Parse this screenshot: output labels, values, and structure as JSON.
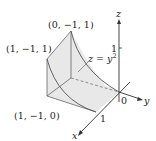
{
  "figure": {
    "points": {
      "top": "(0, −1, 1)",
      "left": "(1, −1, 1)",
      "bottom_left": "(1, −1, 0)"
    },
    "surface_label": "z = y",
    "surface_exponent": "2",
    "axes": {
      "x": "x",
      "y": "y",
      "z": "z",
      "origin": "0",
      "x_tick": "1",
      "z_tick": "1"
    },
    "colors": {
      "line": "#555555",
      "fill": "#e6e6e6",
      "axis": "#333333"
    }
  }
}
